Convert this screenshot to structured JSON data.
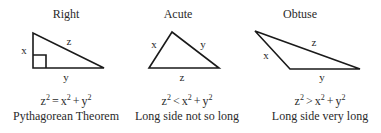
{
  "triangles": [
    {
      "title": "Right",
      "labels": {
        "x": "x",
        "y": "y",
        "z": "z"
      },
      "equation": {
        "lhs": "z",
        "op": "=",
        "rhs1": "x",
        "plus": "+",
        "rhs2": "y",
        "exp": "2"
      },
      "caption": "Pythagorean Theorem"
    },
    {
      "title": "Acute",
      "labels": {
        "x": "x",
        "y": "y",
        "z": "z"
      },
      "equation": {
        "lhs": "z",
        "op": "<",
        "rhs1": "x",
        "plus": "+",
        "rhs2": "y",
        "exp": "2"
      },
      "caption": "Long side not so long"
    },
    {
      "title": "Obtuse",
      "labels": {
        "x": "x",
        "y": "y",
        "z": "z"
      },
      "equation": {
        "lhs": "z",
        "op": ">",
        "rhs1": "x",
        "plus": "+",
        "rhs2": "y",
        "exp": "2"
      },
      "caption": "Long side very long"
    }
  ],
  "colors": {
    "line": "#1a1a1a",
    "text": "#2a2a2a",
    "background": "#ffffff"
  }
}
